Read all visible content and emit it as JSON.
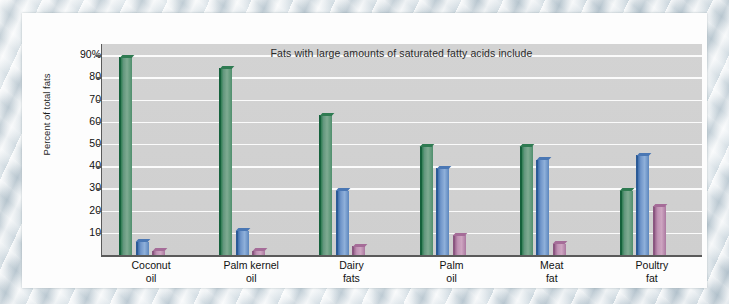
{
  "chart_data": {
    "type": "bar",
    "title": "Fats with large amounts of saturated fatty acids include",
    "xlabel": "",
    "ylabel": "Percent of total fats",
    "ylim": [
      0,
      95
    ],
    "grid": true,
    "legend": "none",
    "categories": [
      "Coconut\noil",
      "Palm kernel\noil",
      "Dairy\nfats",
      "Palm\noil",
      "Meat\nfat",
      "Poultry\nfat"
    ],
    "category_lines": [
      [
        "Coconut",
        "oil"
      ],
      [
        "Palm kernel",
        "oil"
      ],
      [
        "Dairy",
        "fats"
      ],
      [
        "Palm",
        "oil"
      ],
      [
        "Meat",
        "fat"
      ],
      [
        "Poultry",
        "fat"
      ]
    ],
    "ytick_labels": [
      "90%",
      "80",
      "70",
      "60",
      "50",
      "40",
      "30",
      "20",
      "10"
    ],
    "ytick_values": [
      90,
      80,
      70,
      60,
      50,
      40,
      30,
      20,
      10
    ],
    "series": [
      {
        "name": "saturated fatty acids",
        "color": "#5a9478",
        "values": [
          89,
          84,
          63,
          49,
          49,
          29
        ]
      },
      {
        "name": "monounsaturated fatty acids",
        "color": "#6b95c8",
        "values": [
          6,
          11,
          29,
          39,
          43,
          45
        ]
      },
      {
        "name": "polyunsaturated fatty acids",
        "color": "#b887ab",
        "values": [
          2,
          2,
          4,
          9,
          5,
          22
        ]
      }
    ],
    "colors": {
      "plot_background": "#d1d1d1",
      "gridline": "#fbfbfb",
      "axis": "#5a5a5a",
      "paper": "#fdfdfd",
      "series_green": "#5a9478",
      "series_blue": "#6b95c8",
      "series_purple": "#b887ab"
    }
  }
}
